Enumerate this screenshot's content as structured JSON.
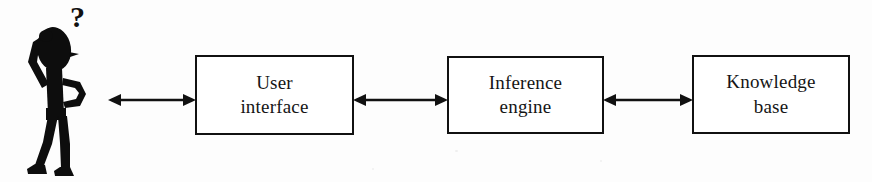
{
  "diagram": {
    "background_color": "#fdfdfd",
    "stroke_color": "#111111",
    "text_color": "#151515",
    "actor": {
      "name": "user",
      "icon": "puzzled-stick-figure-icon",
      "thought_symbol": "?"
    },
    "nodes": [
      {
        "id": "user-interface",
        "label": "User\ninterface",
        "line1": "User",
        "line2": "interface",
        "shape": "rectangle"
      },
      {
        "id": "inference-engine",
        "label": "Inference\nengine",
        "line1": "Inference",
        "line2": "engine",
        "shape": "rectangle"
      },
      {
        "id": "knowledge-base",
        "label": "Knowledge\nbase",
        "line1": "Knowledge",
        "line2": "base",
        "shape": "rectangle"
      }
    ],
    "connectors": [
      {
        "id": "user-to-user-interface",
        "from": "user",
        "to": "user-interface",
        "style": "double-headed-arrow",
        "label": ""
      },
      {
        "id": "user-interface-to-inference-engine",
        "from": "user-interface",
        "to": "inference-engine",
        "style": "double-headed-arrow",
        "label": ""
      },
      {
        "id": "inference-engine-to-knowledge-base",
        "from": "inference-engine",
        "to": "knowledge-base",
        "style": "double-headed-arrow",
        "label": ""
      }
    ]
  }
}
